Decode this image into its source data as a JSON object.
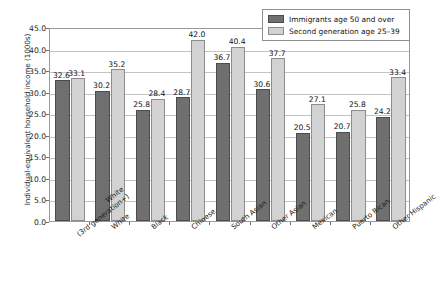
{
  "chart_data": {
    "type": "bar",
    "title": "",
    "xlabel": "",
    "ylabel": "Individual-equivalent household income (1000s)",
    "ylim": [
      0.0,
      45.0
    ],
    "ytick_labels": [
      "45.0",
      "40.0",
      "35.0",
      "30.0",
      "25.0",
      "20.0",
      "15.0",
      "10.0",
      "5.0",
      "0.0"
    ],
    "yticks": [
      45.0,
      40.0,
      35.0,
      30.0,
      25.0,
      20.0,
      15.0,
      10.0,
      5.0,
      0.0
    ],
    "grid": true,
    "legend_position": "top-right",
    "categories": [
      "White\n(3rd generation+)",
      "White",
      "Black",
      "Chinese",
      "South Asian",
      "Other Asian",
      "Mexican",
      "Puerto Rican",
      "Other Hispanic"
    ],
    "category_lines": [
      [
        "White",
        "(3rd generation+)"
      ],
      [
        "White",
        ""
      ],
      [
        "Black",
        ""
      ],
      [
        "Chinese",
        ""
      ],
      [
        "South Asian",
        ""
      ],
      [
        "Other Asian",
        ""
      ],
      [
        "Mexican",
        ""
      ],
      [
        "Puerto Rican",
        ""
      ],
      [
        "Other Hispanic",
        ""
      ]
    ],
    "series": [
      {
        "name": "Immigrants age 50 and over",
        "color": "#706f70",
        "values": [
          32.6,
          30.2,
          25.8,
          28.7,
          36.7,
          30.6,
          20.5,
          20.7,
          24.2
        ],
        "labels": [
          "32.6",
          "30.2",
          "25.8",
          "28.7",
          "36.7",
          "30.6",
          "20.5",
          "20.7",
          "24.2"
        ]
      },
      {
        "name": "Second generation age 25–39",
        "color": "#d2d2d2",
        "values": [
          33.1,
          35.2,
          28.4,
          42.0,
          40.4,
          37.7,
          27.1,
          25.8,
          33.4
        ],
        "labels": [
          "33.1",
          "35.2",
          "28.4",
          "42.0",
          "40.4",
          "37.7",
          "27.1",
          "25.8",
          "33.4"
        ]
      }
    ]
  },
  "legend": {
    "items": [
      {
        "label": "Immigrants age 50 and over"
      },
      {
        "label": "Second generation age 25–39"
      }
    ]
  }
}
